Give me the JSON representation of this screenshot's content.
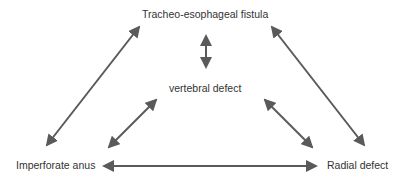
{
  "nodes": {
    "top": "Tracheo-esophageal fistula",
    "center": "vertebral defect",
    "left": "Imperforate anus",
    "right": "Radial defect"
  },
  "edges": [
    {
      "from": "top",
      "to": "center",
      "type": "bidirectional"
    },
    {
      "from": "top",
      "to": "left",
      "type": "bidirectional"
    },
    {
      "from": "top",
      "to": "right",
      "type": "bidirectional"
    },
    {
      "from": "center",
      "to": "left",
      "type": "bidirectional"
    },
    {
      "from": "center",
      "to": "right",
      "type": "bidirectional"
    },
    {
      "from": "left",
      "to": "right",
      "type": "bidirectional"
    }
  ],
  "colors": {
    "arrow": "#5a5a5a",
    "text": "#333333"
  }
}
